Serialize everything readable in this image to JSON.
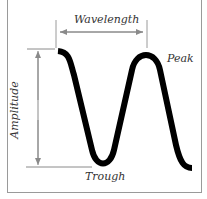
{
  "diagram": {
    "type": "wave-anatomy",
    "labels": {
      "wavelength": "Wavelength",
      "peak": "Peak",
      "amplitude": "Amplitude",
      "trough": "Trough"
    },
    "colors": {
      "wave": "#000000",
      "guides": "#8a8a8a",
      "text": "#333333",
      "frame": "#9a9a9a"
    }
  }
}
